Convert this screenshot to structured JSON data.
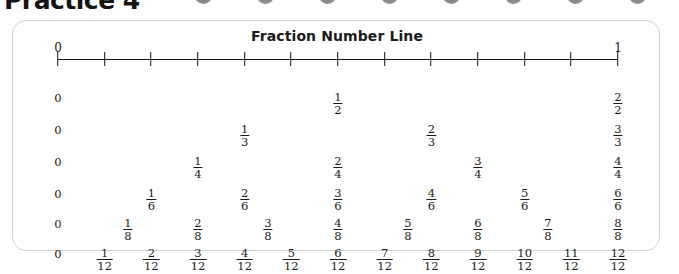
{
  "worksheet_header": {
    "title": "Practice 4",
    "dot_count": 8,
    "dot_color": "#8c8c8c"
  },
  "card": {
    "title": "Fraction Number Line",
    "border_color": "#cfcfcf",
    "background": "#ffffff"
  },
  "number_line": {
    "start_label": "0",
    "end_label": "1",
    "line_color": "#111111",
    "divisions": 12,
    "tick_fractions": [
      0,
      0.0833,
      0.1667,
      0.25,
      0.3333,
      0.4167,
      0.5,
      0.5833,
      0.6667,
      0.75,
      0.8333,
      0.9167,
      1
    ]
  },
  "chart_data": {
    "type": "table",
    "title": "Fraction Number Line",
    "xlabel": "",
    "ylabel": "",
    "xlim": [
      0,
      1
    ],
    "grid": false,
    "axis_tick_labels": [
      "0",
      "1"
    ],
    "rows": [
      {
        "name": "halves",
        "denominator": 2,
        "labels": [
          "0",
          "1/2",
          "2/2"
        ],
        "cells": [
          {
            "whole": "0",
            "num": "",
            "den": "",
            "pos": 0
          },
          {
            "whole": "",
            "num": "1",
            "den": "2",
            "pos": 0.5
          },
          {
            "whole": "",
            "num": "2",
            "den": "2",
            "pos": 1
          }
        ]
      },
      {
        "name": "thirds",
        "denominator": 3,
        "labels": [
          "0",
          "1/3",
          "2/3",
          "3/3"
        ],
        "cells": [
          {
            "whole": "0",
            "num": "",
            "den": "",
            "pos": 0
          },
          {
            "whole": "",
            "num": "1",
            "den": "3",
            "pos": 0.3333
          },
          {
            "whole": "",
            "num": "2",
            "den": "3",
            "pos": 0.6667
          },
          {
            "whole": "",
            "num": "3",
            "den": "3",
            "pos": 1
          }
        ]
      },
      {
        "name": "fourths",
        "denominator": 4,
        "labels": [
          "0",
          "1/4",
          "2/4",
          "3/4",
          "4/4"
        ],
        "cells": [
          {
            "whole": "0",
            "num": "",
            "den": "",
            "pos": 0
          },
          {
            "whole": "",
            "num": "1",
            "den": "4",
            "pos": 0.25
          },
          {
            "whole": "",
            "num": "2",
            "den": "4",
            "pos": 0.5
          },
          {
            "whole": "",
            "num": "3",
            "den": "4",
            "pos": 0.75
          },
          {
            "whole": "",
            "num": "4",
            "den": "4",
            "pos": 1
          }
        ]
      },
      {
        "name": "sixths",
        "denominator": 6,
        "labels": [
          "0",
          "1/6",
          "2/6",
          "3/6",
          "4/6",
          "5/6",
          "6/6"
        ],
        "cells": [
          {
            "whole": "0",
            "num": "",
            "den": "",
            "pos": 0
          },
          {
            "whole": "",
            "num": "1",
            "den": "6",
            "pos": 0.1667
          },
          {
            "whole": "",
            "num": "2",
            "den": "6",
            "pos": 0.3333
          },
          {
            "whole": "",
            "num": "3",
            "den": "6",
            "pos": 0.5
          },
          {
            "whole": "",
            "num": "4",
            "den": "6",
            "pos": 0.6667
          },
          {
            "whole": "",
            "num": "5",
            "den": "6",
            "pos": 0.8333
          },
          {
            "whole": "",
            "num": "6",
            "den": "6",
            "pos": 1
          }
        ]
      },
      {
        "name": "eighths",
        "denominator": 8,
        "labels": [
          "0",
          "1/8",
          "2/8",
          "3/8",
          "4/8",
          "5/8",
          "6/8",
          "7/8",
          "8/8"
        ],
        "cells": [
          {
            "whole": "0",
            "num": "",
            "den": "",
            "pos": 0
          },
          {
            "whole": "",
            "num": "1",
            "den": "8",
            "pos": 0.125
          },
          {
            "whole": "",
            "num": "2",
            "den": "8",
            "pos": 0.25
          },
          {
            "whole": "",
            "num": "3",
            "den": "8",
            "pos": 0.375
          },
          {
            "whole": "",
            "num": "4",
            "den": "8",
            "pos": 0.5
          },
          {
            "whole": "",
            "num": "5",
            "den": "8",
            "pos": 0.625
          },
          {
            "whole": "",
            "num": "6",
            "den": "8",
            "pos": 0.75
          },
          {
            "whole": "",
            "num": "7",
            "den": "8",
            "pos": 0.875
          },
          {
            "whole": "",
            "num": "8",
            "den": "8",
            "pos": 1
          }
        ]
      },
      {
        "name": "twelfths",
        "denominator": 12,
        "labels": [
          "0",
          "1/12",
          "2/12",
          "3/12",
          "4/12",
          "5/12",
          "6/12",
          "7/12",
          "8/12",
          "9/12",
          "10/12",
          "11/12",
          "12/12"
        ],
        "cells": [
          {
            "whole": "0",
            "num": "",
            "den": "",
            "pos": 0
          },
          {
            "whole": "",
            "num": "1",
            "den": "12",
            "pos": 0.0833
          },
          {
            "whole": "",
            "num": "2",
            "den": "12",
            "pos": 0.1667
          },
          {
            "whole": "",
            "num": "3",
            "den": "12",
            "pos": 0.25
          },
          {
            "whole": "",
            "num": "4",
            "den": "12",
            "pos": 0.3333
          },
          {
            "whole": "",
            "num": "5",
            "den": "12",
            "pos": 0.4167
          },
          {
            "whole": "",
            "num": "6",
            "den": "12",
            "pos": 0.5
          },
          {
            "whole": "",
            "num": "7",
            "den": "12",
            "pos": 0.5833
          },
          {
            "whole": "",
            "num": "8",
            "den": "12",
            "pos": 0.6667
          },
          {
            "whole": "",
            "num": "9",
            "den": "12",
            "pos": 0.75
          },
          {
            "whole": "",
            "num": "10",
            "den": "12",
            "pos": 0.8333
          },
          {
            "whole": "",
            "num": "11",
            "den": "12",
            "pos": 0.9167
          },
          {
            "whole": "",
            "num": "12",
            "den": "12",
            "pos": 1
          }
        ]
      }
    ],
    "row_y": [
      70,
      102,
      134,
      166,
      196,
      226
    ]
  }
}
